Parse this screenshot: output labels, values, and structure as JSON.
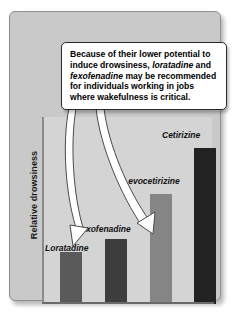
{
  "figure": {
    "background": "#ffffff",
    "panel_color": "#c9c9c9",
    "plot_color": "#d4d4d4"
  },
  "callout": {
    "text_part_1": "Because of their lower potential to induce drowsiness, ",
    "emphasis_1": "loratadine",
    "text_part_2": " and ",
    "emphasis_2": "fexofenadine",
    "text_part_3": " may be recommended for individuals working in jobs where wakefulness is critical."
  },
  "axis": {
    "y_label": "Relative drowsiness"
  },
  "arrows": {
    "arrow_1_target": "Loratadine",
    "arrow_2_target": "Fexofenadine"
  },
  "chart_data": {
    "type": "bar",
    "title": "",
    "xlabel": "",
    "ylabel": "Relative drowsiness",
    "categories": [
      "Loratadine",
      "Fexofenadine",
      "Levocetirizine",
      "Cetirizine"
    ],
    "values": [
      30,
      37,
      63,
      89
    ],
    "ylim": [
      0,
      100
    ],
    "grid": false,
    "legend": "none",
    "bar_colors": [
      "#5a5a5a",
      "#3d3d3d",
      "#858585",
      "#222222"
    ],
    "annotations": [
      "Because of their lower potential to induce drowsiness, loratadine and fexofenadine may be recommended for individuals working in jobs where wakefulness is critical."
    ]
  }
}
